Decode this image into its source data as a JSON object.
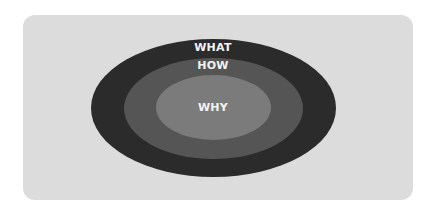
{
  "diagram": {
    "type": "nested-ellipses",
    "layers": [
      {
        "label": "WHAT",
        "color": "#2b2b2b"
      },
      {
        "label": "HOW",
        "color": "#555555"
      },
      {
        "label": "WHY",
        "color": "#7b7b7b"
      }
    ],
    "background_color": "#dcdcdc"
  }
}
